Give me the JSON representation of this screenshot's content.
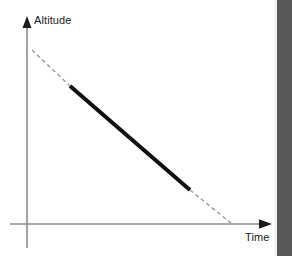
{
  "figure": {
    "title": "",
    "background_color": "#ffffff",
    "width": 292,
    "height": 256
  },
  "axes": {
    "y_axis": {
      "label": "Altitude",
      "icon": "up-arrow-icon",
      "color": "#8c8c8c",
      "arrow_color": "#1b1b1b",
      "x": 27,
      "top": 20,
      "bottom": 248
    },
    "x_axis": {
      "label": "Time",
      "icon": "right-arrow-icon",
      "color": "#8c8c8c",
      "arrow_color": "#1b1b1b",
      "y": 224,
      "left": 10,
      "right": 272
    }
  },
  "series": {
    "name": "descent-profile",
    "solid_color": "#111111",
    "dashed_color": "#999999",
    "solid_width": 4,
    "dashed_width": 1.4,
    "dash_pattern": "4 3",
    "segments": [
      {
        "name": "pre-approach-projection",
        "style": "dashed",
        "x1": 32,
        "y1": 50,
        "x2": 70,
        "y2": 86
      },
      {
        "name": "stabilized-descent",
        "style": "solid",
        "x1": 70,
        "y1": 86,
        "x2": 190,
        "y2": 190
      },
      {
        "name": "touchdown-projection",
        "style": "dashed",
        "x1": 190,
        "y1": 190,
        "x2": 232,
        "y2": 224
      }
    ]
  },
  "artifacts": {
    "page_edge_band": {
      "name": "scan-edge-shadow",
      "color": "#585858",
      "highlight_color": "#f2f2f2",
      "x": 277,
      "width": 15
    }
  },
  "chart_data": {
    "type": "line",
    "title": "",
    "subtitle": "",
    "xlabel": "Time",
    "ylabel": "Altitude",
    "grid": false,
    "legend_position": "none",
    "axis_ticks": [],
    "tick_labels": [],
    "xlim": [
      0,
      1
    ],
    "ylim": [
      0,
      1
    ],
    "annotations": [],
    "series": [
      {
        "name": "Projected descent path (before)",
        "style": "dashed",
        "color": "#999999",
        "x": [
          0.025,
          0.22
        ],
        "y": [
          0.853,
          0.676
        ]
      },
      {
        "name": "Constant-rate descent",
        "style": "solid",
        "color": "#111111",
        "x": [
          0.22,
          0.8
        ],
        "y": [
          0.676,
          0.167
        ]
      },
      {
        "name": "Projected descent path (after)",
        "style": "dashed",
        "color": "#999999",
        "x": [
          0.8,
          1.0
        ],
        "y": [
          0.167,
          0.0
        ]
      }
    ]
  }
}
